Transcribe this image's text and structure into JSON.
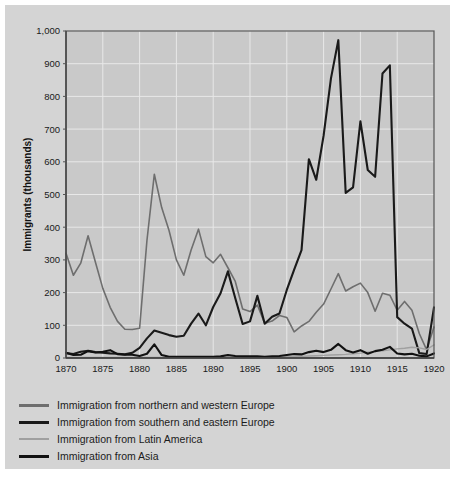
{
  "chart_data": {
    "type": "line",
    "title": "",
    "xlabel": "Year",
    "ylabel": "Immigrants (thousands)",
    "xlim": [
      1870,
      1920
    ],
    "ylim": [
      0,
      1000
    ],
    "xticks": [
      1870,
      1875,
      1880,
      1885,
      1890,
      1895,
      1900,
      1905,
      1910,
      1915,
      1920
    ],
    "xtick_labels": [
      "1870",
      "1875",
      "1880",
      "1885",
      "1890",
      "1895",
      "1900",
      "1905",
      "1910",
      "1915",
      "1920"
    ],
    "yticks": [
      0,
      100,
      200,
      300,
      400,
      500,
      600,
      700,
      800,
      900,
      1000
    ],
    "ytick_labels": [
      "0",
      "100",
      "200",
      "300",
      "400",
      "500",
      "600",
      "700",
      "800",
      "900",
      "1,000"
    ],
    "grid": true,
    "legend_position": "below-plot",
    "x": [
      1870,
      1871,
      1872,
      1873,
      1874,
      1875,
      1876,
      1877,
      1878,
      1879,
      1880,
      1881,
      1882,
      1883,
      1884,
      1885,
      1886,
      1887,
      1888,
      1889,
      1890,
      1891,
      1892,
      1893,
      1894,
      1895,
      1896,
      1897,
      1898,
      1899,
      1900,
      1901,
      1902,
      1903,
      1904,
      1905,
      1906,
      1907,
      1908,
      1909,
      1910,
      1911,
      1912,
      1913,
      1914,
      1915,
      1916,
      1917,
      1918,
      1919,
      1920
    ],
    "series": [
      {
        "name": "Immigration from northern and western Europe",
        "color": "#6e6e6e",
        "width": 1.6,
        "values": [
          320,
          253,
          290,
          374,
          293,
          213,
          155,
          112,
          88,
          87,
          91,
          360,
          562,
          460,
          390,
          300,
          253,
          330,
          394,
          310,
          291,
          317,
          276,
          234,
          150,
          142,
          162,
          106,
          113,
          130,
          124,
          80,
          98,
          112,
          140,
          165,
          211,
          258,
          205,
          218,
          229,
          200,
          143,
          198,
          192,
          146,
          173,
          146,
          75,
          25,
          95
        ]
      },
      {
        "name": "Immigration from southern and eastern Europe",
        "color": "#1a1a1a",
        "width": 2.1,
        "values": [
          15,
          12,
          19,
          22,
          18,
          16,
          14,
          13,
          11,
          16,
          31,
          60,
          84,
          77,
          70,
          65,
          68,
          105,
          136,
          100,
          156,
          198,
          265,
          183,
          104,
          112,
          190,
          105,
          126,
          136,
          208,
          270,
          330,
          608,
          545,
          680,
          855,
          972,
          505,
          522,
          724,
          575,
          554,
          870,
          895,
          125,
          105,
          90,
          15,
          12,
          155
        ]
      },
      {
        "name": "Immigration from Latin America",
        "color": "#a0a0a0",
        "width": 1.4,
        "values": [
          2,
          2,
          2,
          2,
          2,
          2,
          2,
          2,
          2,
          2,
          2,
          2,
          2,
          2,
          2,
          2,
          2,
          2,
          2,
          2,
          2,
          2,
          3,
          3,
          3,
          3,
          3,
          3,
          3,
          3,
          4,
          4,
          5,
          6,
          7,
          8,
          9,
          10,
          11,
          13,
          15,
          18,
          20,
          22,
          25,
          28,
          30,
          33,
          31,
          26,
          40
        ]
      },
      {
        "name": "Immigration from Asia",
        "color": "#111111",
        "width": 2.1,
        "values": [
          16,
          9,
          10,
          21,
          17,
          19,
          24,
          12,
          10,
          10,
          6,
          13,
          42,
          9,
          4,
          4,
          4,
          4,
          4,
          4,
          4,
          5,
          9,
          6,
          5,
          5,
          5,
          4,
          5,
          6,
          9,
          12,
          11,
          18,
          22,
          18,
          25,
          43,
          24,
          17,
          24,
          13,
          21,
          25,
          34,
          14,
          11,
          13,
          7,
          5,
          14
        ]
      }
    ]
  },
  "legend": {
    "items": [
      {
        "label": "Immigration from northern and western Europe",
        "color": "#6e6e6e",
        "thin": false
      },
      {
        "label": "Immigration from southern and eastern Europe",
        "color": "#1a1a1a",
        "thin": false
      },
      {
        "label": "Immigration from Latin America",
        "color": "#a0a0a0",
        "thin": true
      },
      {
        "label": "Immigration from Asia",
        "color": "#111111",
        "thin": false
      }
    ]
  },
  "colors": {
    "panel_background": "#d4d4d4",
    "plot_background": "#c9c9c9",
    "gridline": "#e8e8e8",
    "axis_line": "#555555",
    "text": "#1a1a1a"
  }
}
